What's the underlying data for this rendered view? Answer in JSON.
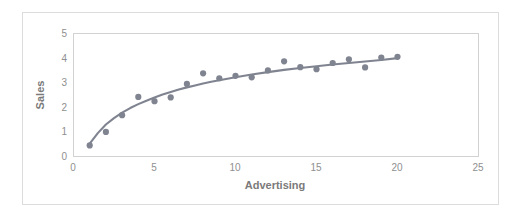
{
  "chart_data": {
    "type": "scatter",
    "title": "",
    "xlabel": "Advertising",
    "ylabel": "Sales",
    "xlim": [
      0,
      25
    ],
    "ylim": [
      0,
      5
    ],
    "xticks": [
      0,
      5,
      10,
      15,
      20,
      25
    ],
    "yticks": [
      0,
      1,
      2,
      3,
      4,
      5
    ],
    "xtick_labels": [
      "0",
      "5",
      "10",
      "15",
      "20",
      "25"
    ],
    "ytick_labels": [
      "0",
      "1",
      "2",
      "3",
      "4",
      "5"
    ],
    "grid": false,
    "legend": null,
    "marker_color": "#7f8490",
    "line_color": "#7f8490",
    "plot_border_color": "#d2d2d2",
    "frame_border_color": "#dcdcdc",
    "background_color": "#ffffff",
    "x": [
      1,
      2,
      3,
      4,
      5,
      6,
      7,
      8,
      9,
      10,
      11,
      12,
      13,
      14,
      15,
      16,
      17,
      18,
      19,
      20
    ],
    "y": [
      0.45,
      1.0,
      1.68,
      2.42,
      2.25,
      2.4,
      2.95,
      3.38,
      3.18,
      3.28,
      3.22,
      3.5,
      3.87,
      3.63,
      3.55,
      3.8,
      3.95,
      3.62,
      4.02,
      4.05
    ],
    "series": [
      {
        "name": "Observations",
        "type": "scatter",
        "values": [
          0.45,
          1.0,
          1.68,
          2.42,
          2.25,
          2.4,
          2.95,
          3.38,
          3.18,
          3.28,
          3.22,
          3.5,
          3.87,
          3.63,
          3.55,
          3.8,
          3.95,
          3.62,
          4.02,
          4.05
        ]
      },
      {
        "name": "Fitted curve",
        "type": "line",
        "x": [
          1,
          1.5,
          2,
          2.5,
          3,
          3.5,
          4,
          4.5,
          5,
          5.5,
          6,
          6.5,
          7,
          7.5,
          8,
          8.5,
          9,
          9.5,
          10,
          11,
          12,
          13,
          14,
          15,
          16,
          17,
          18,
          19,
          20
        ],
        "values": [
          0.52,
          0.95,
          1.3,
          1.56,
          1.78,
          1.97,
          2.13,
          2.27,
          2.4,
          2.52,
          2.62,
          2.72,
          2.81,
          2.89,
          2.97,
          3.04,
          3.1,
          3.16,
          3.22,
          3.33,
          3.43,
          3.52,
          3.6,
          3.67,
          3.74,
          3.8,
          3.86,
          3.92,
          4.0
        ]
      }
    ]
  },
  "axes": {
    "x_title": "Advertising",
    "y_title": "Sales"
  }
}
